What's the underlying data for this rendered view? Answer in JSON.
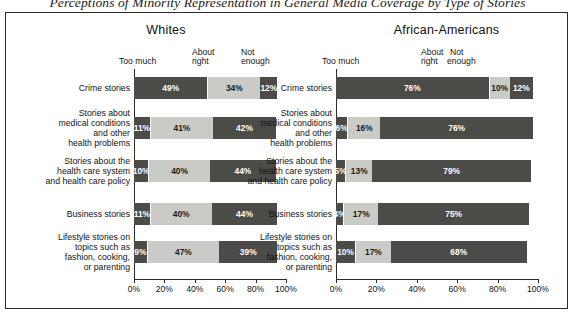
{
  "figure": {
    "title": "Perceptions of Minority Representation in General Media Coverage by Type of Stories"
  },
  "panels": [
    {
      "name": "Whites",
      "title": "Whites",
      "legend": {
        "too_much": "Too much",
        "about_right_l1": "About",
        "about_right_l2": "right",
        "not_enough_l1": "Not",
        "not_enough_l2": "enough"
      }
    },
    {
      "name": "African-Americans",
      "title": "African-Americans",
      "legend": {
        "too_much": "Too much",
        "about_right_l1": "About",
        "about_right_l2": "right",
        "not_enough_l1": "Not",
        "not_enough_l2": "enough"
      }
    }
  ],
  "axis": {
    "ticks": [
      "0%",
      "20%",
      "40%",
      "60%",
      "80%",
      "100%"
    ],
    "values": [
      0,
      20,
      40,
      60,
      80,
      100
    ]
  },
  "categories": [
    {
      "lines": [
        "Crime stories"
      ]
    },
    {
      "lines": [
        "Stories about",
        "medical conditions",
        "and other",
        "health problems"
      ]
    },
    {
      "lines": [
        "Stories about the",
        "health care system",
        "and health care policy"
      ]
    },
    {
      "lines": [
        "Business stories"
      ]
    },
    {
      "lines": [
        "Lifestyle stories on",
        "topics such as",
        "fashion, cooking,",
        "or parenting"
      ]
    }
  ],
  "chart_data": {
    "type": "bar",
    "orientation": "horizontal",
    "stacked": true,
    "title": "Perceptions of Minority Representation in General Media Coverage by Type of Stories",
    "xlabel": "",
    "ylabel": "",
    "xlim": [
      0,
      100
    ],
    "grid": false,
    "legend_position": "top",
    "series_names": [
      "Too much",
      "About right",
      "Not enough"
    ],
    "series_colors": [
      "#4b4b48",
      "#cacac6",
      "#4b4b48"
    ],
    "categories": [
      "Crime stories",
      "Stories about medical conditions and other health problems",
      "Stories about the health care system and health care policy",
      "Business stories",
      "Lifestyle stories on topics such as fashion, cooking, or parenting"
    ],
    "panels": [
      {
        "name": "Whites",
        "series": [
          {
            "name": "Too much",
            "values": [
              49,
              11,
              10,
              11,
              9
            ]
          },
          {
            "name": "About right",
            "values": [
              34,
              41,
              40,
              40,
              47
            ]
          },
          {
            "name": "Not enough",
            "values": [
              12,
              42,
              44,
              44,
              39
            ]
          }
        ]
      },
      {
        "name": "African-Americans",
        "series": [
          {
            "name": "Too much",
            "values": [
              76,
              6,
              5,
              4,
              10
            ]
          },
          {
            "name": "About right",
            "values": [
              10,
              16,
              13,
              17,
              17
            ]
          },
          {
            "name": "Not enough",
            "values": [
              12,
              76,
              79,
              75,
              68
            ]
          }
        ]
      }
    ],
    "labels": {
      "Whites": [
        [
          "49%",
          "34%",
          "12%"
        ],
        [
          "11%",
          "41%",
          "42%"
        ],
        [
          "10%",
          "40%",
          "44%"
        ],
        [
          "11%",
          "40%",
          "44%"
        ],
        [
          "9%",
          "47%",
          "39%"
        ]
      ],
      "African-Americans": [
        [
          "76%",
          "10%",
          "12%"
        ],
        [
          "6%",
          "16%",
          "76%"
        ],
        [
          "5%",
          "13%",
          "79%"
        ],
        [
          "4%",
          "17%",
          "75%"
        ],
        [
          "10%",
          "17%",
          "68%"
        ]
      ]
    }
  }
}
